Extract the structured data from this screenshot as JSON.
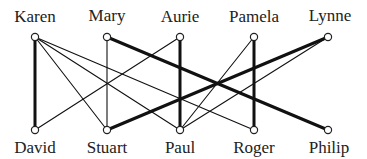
{
  "diagram": {
    "type": "bipartite-graph",
    "colors": {
      "edge": "#111111",
      "node_stroke": "#222222",
      "node_fill": "#ffffff",
      "text": "#222222"
    },
    "top_nodes": [
      {
        "id": "karen",
        "label": "Karen",
        "x": 35,
        "y": 37
      },
      {
        "id": "mary",
        "label": "Mary",
        "x": 107,
        "y": 37
      },
      {
        "id": "aurie",
        "label": "Aurie",
        "x": 180,
        "y": 37
      },
      {
        "id": "pamela",
        "label": "Pamela",
        "x": 254,
        "y": 37
      },
      {
        "id": "lynne",
        "label": "Lynne",
        "x": 328,
        "y": 37
      }
    ],
    "bottom_nodes": [
      {
        "id": "david",
        "label": "David",
        "x": 35,
        "y": 130
      },
      {
        "id": "stuart",
        "label": "Stuart",
        "x": 107,
        "y": 130
      },
      {
        "id": "paul",
        "label": "Paul",
        "x": 180,
        "y": 130
      },
      {
        "id": "roger",
        "label": "Roger",
        "x": 254,
        "y": 130
      },
      {
        "id": "philip",
        "label": "Philip",
        "x": 328,
        "y": 130
      }
    ],
    "edges": [
      {
        "from": "karen",
        "to": "david",
        "weight": "thick"
      },
      {
        "from": "karen",
        "to": "stuart",
        "weight": "thin"
      },
      {
        "from": "karen",
        "to": "paul",
        "weight": "thin"
      },
      {
        "from": "karen",
        "to": "roger",
        "weight": "thin"
      },
      {
        "from": "mary",
        "to": "stuart",
        "weight": "thin"
      },
      {
        "from": "mary",
        "to": "philip",
        "weight": "thick"
      },
      {
        "from": "aurie",
        "to": "paul",
        "weight": "thick"
      },
      {
        "from": "aurie",
        "to": "david",
        "weight": "thin"
      },
      {
        "from": "pamela",
        "to": "roger",
        "weight": "thick"
      },
      {
        "from": "pamela",
        "to": "paul",
        "weight": "thin"
      },
      {
        "from": "lynne",
        "to": "stuart",
        "weight": "thick"
      },
      {
        "from": "lynne",
        "to": "paul",
        "weight": "thin"
      }
    ]
  }
}
